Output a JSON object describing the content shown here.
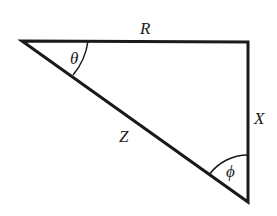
{
  "diagram": {
    "type": "right-triangle",
    "labels": {
      "top_side": "R",
      "right_side": "X",
      "hypotenuse": "Z",
      "left_angle": "θ",
      "bottom_angle": "ϕ"
    },
    "colors": {
      "stroke": "#1a1a1a",
      "background": "#ffffff"
    }
  }
}
